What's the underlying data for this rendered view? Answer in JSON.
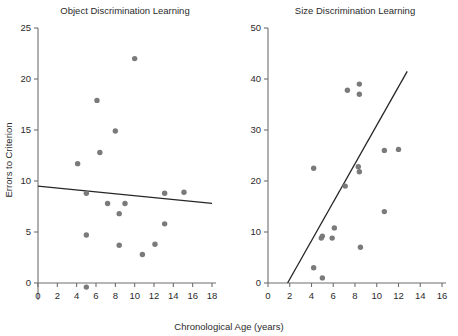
{
  "figure": {
    "xlabel": "Chronological Age (years)",
    "ylabel": "Errors to Criterion",
    "point_color": "#7a7a7a",
    "line_color": "#262626",
    "axis_color": "#6f6f6f"
  },
  "chart_data": [
    {
      "type": "scatter",
      "title": "Object Discrimination Learning",
      "xlabel": "Chronological Age (years)",
      "ylabel": "Errors to Criterion",
      "xlim": [
        0,
        18
      ],
      "ylim": [
        0,
        25
      ],
      "y_axis_extends_below_zero": true,
      "grid": false,
      "legend": "none",
      "xticks": [
        0,
        2,
        4,
        6,
        8,
        10,
        12,
        14,
        16,
        18
      ],
      "xtick_labels": [
        "0",
        "2",
        "4",
        "6",
        "8",
        "10",
        "12",
        "14",
        "16",
        "18"
      ],
      "yticks": [
        0,
        5,
        10,
        15,
        20,
        25
      ],
      "ytick_labels": [
        "0",
        "5",
        "10",
        "15",
        "20",
        "25"
      ],
      "points": [
        {
          "x": 4.1,
          "y": 11.7
        },
        {
          "x": 5.0,
          "y": 8.8
        },
        {
          "x": 5.0,
          "y": 4.7
        },
        {
          "x": 5.0,
          "y": -0.4
        },
        {
          "x": 6.1,
          "y": 17.9
        },
        {
          "x": 6.4,
          "y": 12.8
        },
        {
          "x": 7.2,
          "y": 7.8
        },
        {
          "x": 8.0,
          "y": 14.9
        },
        {
          "x": 8.4,
          "y": 6.8
        },
        {
          "x": 8.4,
          "y": 3.7
        },
        {
          "x": 9.0,
          "y": 7.8
        },
        {
          "x": 10.0,
          "y": 22.0
        },
        {
          "x": 10.8,
          "y": 2.8
        },
        {
          "x": 12.1,
          "y": 3.8
        },
        {
          "x": 13.1,
          "y": 8.8
        },
        {
          "x": 13.1,
          "y": 5.8
        },
        {
          "x": 15.1,
          "y": 8.9
        }
      ],
      "fit_line": {
        "x0": 0.0,
        "y0": 9.5,
        "x1": 18.0,
        "y1": 7.8,
        "trend": "slightly negative"
      }
    },
    {
      "type": "scatter",
      "title": "Size Discrimination Learning",
      "xlabel": "Chronological Age (years)",
      "ylabel": "Errors to Criterion",
      "xlim": [
        0,
        16
      ],
      "ylim": [
        0,
        50
      ],
      "y_axis_extends_below_zero": false,
      "grid": false,
      "legend": "none",
      "xticks": [
        0,
        2,
        4,
        6,
        8,
        10,
        12,
        14,
        16
      ],
      "xtick_labels": [
        "0",
        "2",
        "4",
        "6",
        "8",
        "10",
        "12",
        "14",
        "16"
      ],
      "yticks": [
        0,
        10,
        20,
        30,
        40,
        50
      ],
      "ytick_labels": [
        "0",
        "10",
        "20",
        "30",
        "40",
        "50"
      ],
      "points": [
        {
          "x": 4.2,
          "y": 22.5
        },
        {
          "x": 4.2,
          "y": 3.0
        },
        {
          "x": 4.9,
          "y": 8.8
        },
        {
          "x": 5.0,
          "y": 1.0
        },
        {
          "x": 5.0,
          "y": 9.2
        },
        {
          "x": 5.9,
          "y": 8.8
        },
        {
          "x": 6.1,
          "y": 10.8
        },
        {
          "x": 7.1,
          "y": 19.0
        },
        {
          "x": 7.3,
          "y": 37.8
        },
        {
          "x": 8.3,
          "y": 22.8
        },
        {
          "x": 8.4,
          "y": 21.8
        },
        {
          "x": 8.5,
          "y": 7.0
        },
        {
          "x": 8.4,
          "y": 39.0
        },
        {
          "x": 8.4,
          "y": 37.0
        },
        {
          "x": 10.7,
          "y": 14.0
        },
        {
          "x": 10.7,
          "y": 26.0
        },
        {
          "x": 12.0,
          "y": 26.2
        }
      ],
      "fit_line": {
        "x0": 1.8,
        "y0": 0.0,
        "x1": 12.8,
        "y1": 41.5,
        "trend": "positive"
      }
    }
  ]
}
